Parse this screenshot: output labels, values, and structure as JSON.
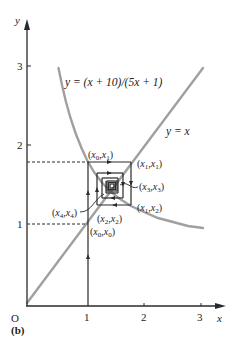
{
  "figure": {
    "panel_label": "(b)",
    "origin_label": "O",
    "x_axis_label": "x",
    "y_axis_label": "y",
    "x_ticks": [
      "1",
      "2",
      "3"
    ],
    "y_ticks": [
      "1",
      "2",
      "3"
    ],
    "curve_label": "y = (x + 10)/(5x + 1)",
    "line_label": "y = x",
    "points": [
      {
        "label": "(x0,x1)",
        "text_base": "(x",
        "sub1": "0",
        "mid": ",x",
        "sub2": "1",
        "end": ")"
      },
      {
        "label": "(x1,x1)",
        "text_base": "(x",
        "sub1": "1",
        "mid": ",x",
        "sub2": "1",
        "end": ")"
      },
      {
        "label": "(x3,x3)",
        "text_base": "(x",
        "sub1": "3",
        "mid": ",x",
        "sub2": "3",
        "end": ")"
      },
      {
        "label": "(x4,x4)",
        "text_base": "(x",
        "sub1": "4",
        "mid": ",x",
        "sub2": "4",
        "end": ")"
      },
      {
        "label": "(x1,x2)",
        "text_base": "(x",
        "sub1": "1",
        "mid": ",x",
        "sub2": "2",
        "end": ")"
      },
      {
        "label": "(x2,x2)",
        "text_base": "(x",
        "sub1": "2",
        "mid": ",x",
        "sub2": "2",
        "end": ")"
      },
      {
        "label": "(x0,x0)",
        "text_base": "(x",
        "sub1": "0",
        "mid": ",x",
        "sub2": "0",
        "end": ")"
      }
    ],
    "colors": {
      "axes": "#2a2a2a",
      "curve": "#9a9a9a",
      "cobweb": "#2a2a2a",
      "dashed": "#2a2a2a"
    }
  }
}
